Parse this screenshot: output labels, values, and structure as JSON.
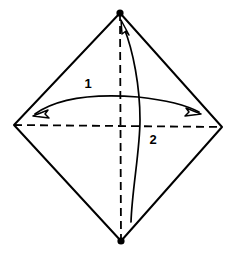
{
  "figure": {
    "kind": "origami-fold-diagram",
    "shape_name": "square-rotated-diamond",
    "background_color": "#ffffff",
    "line_color": "#000000",
    "fill_color": "#ffffff"
  },
  "paper": {
    "outline_name": "square-sheet-outline",
    "stroke_width": 2,
    "vertices": [
      {
        "name": "top-vertex",
        "x": 120,
        "y": 13
      },
      {
        "name": "right-vertex",
        "x": 222,
        "y": 127
      },
      {
        "name": "bottom-vertex",
        "x": 121,
        "y": 241
      },
      {
        "name": "left-vertex",
        "x": 14,
        "y": 125
      }
    ],
    "corner_dots": [
      {
        "name": "top-corner-dot",
        "x": 120,
        "y": 13,
        "r": 3.6
      },
      {
        "name": "bottom-corner-dot",
        "x": 121,
        "y": 241,
        "r": 3.6
      }
    ]
  },
  "creases": [
    {
      "name": "horizontal-crease-line",
      "style": "dashed",
      "x1": 14,
      "y1": 125,
      "x2": 222,
      "y2": 127,
      "dash": "8,5",
      "stroke_width": 1.8
    },
    {
      "name": "vertical-crease-line",
      "style": "dashed",
      "x1": 120,
      "y1": 13,
      "x2": 121,
      "y2": 241,
      "dash": "8,5",
      "stroke_width": 1.8
    }
  ],
  "arrows": [
    {
      "id": "arrow-1",
      "label": "1",
      "label_x": 88,
      "label_y": 88,
      "heads": "double",
      "description": "horizontal double-headed arc bowing upward across the sheet",
      "path": "M 35 114 C 60 96, 100 94, 138 97 C 165 100, 188 106, 199 112",
      "stroke_width": 1.7,
      "head_left": {
        "tip_x": 33,
        "tip_y": 116,
        "angle_deg": 205
      },
      "head_right": {
        "tip_x": 201,
        "tip_y": 114,
        "angle_deg": 27
      }
    },
    {
      "id": "arrow-2",
      "label": "2",
      "label_x": 153,
      "label_y": 144,
      "heads": "single",
      "description": "vertical curve from near the bottom corner sweeping up to the top corner",
      "path": "M 131 222 C 132 190, 140 150, 140 120 C 140 86, 133 50, 124 28",
      "stroke_width": 1.7,
      "head_top": {
        "tip_x": 121,
        "tip_y": 20,
        "angle_deg": -69
      }
    }
  ],
  "labels": [
    {
      "name": "step-number-1",
      "text": "1"
    },
    {
      "name": "step-number-2",
      "text": "2"
    }
  ]
}
